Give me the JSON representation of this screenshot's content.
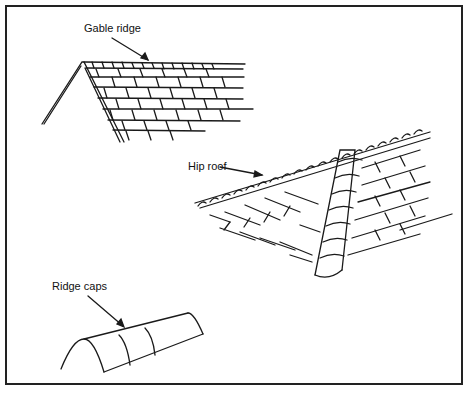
{
  "labels": {
    "gable_ridge": "Gable ridge",
    "hip_roof": "Hip roof",
    "ridge_caps": "Ridge caps"
  }
}
